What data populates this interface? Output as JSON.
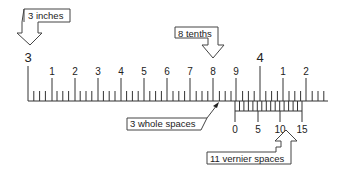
{
  "diagram": {
    "main_scale": {
      "start_label": "3",
      "inch_label": "4",
      "tenth_labels": [
        "1",
        "2",
        "3",
        "4",
        "5",
        "6",
        "7",
        "8",
        "9"
      ],
      "after_inch_labels": [
        "1",
        "2"
      ]
    },
    "vernier_scale": {
      "labels": [
        "0",
        "5",
        "10",
        "15"
      ]
    },
    "callouts": {
      "inches": "3 inches",
      "tenths": "8 tenths",
      "whole_spaces": "3 whole spaces",
      "vernier_spaces": "11 vernier spaces"
    },
    "colors": {
      "line": "#333333",
      "background": "#ffffff"
    }
  }
}
